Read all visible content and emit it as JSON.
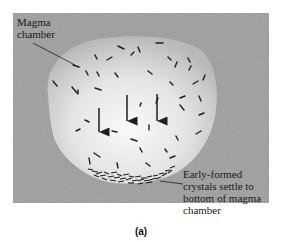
{
  "figure": {
    "caption": "(a)",
    "labels": {
      "magma_chamber": [
        "Magma",
        "chamber"
      ],
      "settled_crystals": [
        "Early-formed",
        "crystals settle to",
        "bottom of magma",
        "chamber"
      ]
    },
    "icons": {
      "arrows": "down-arrow-icon",
      "crystals": "crystal-dash-icon"
    },
    "colors": {
      "background_panel": "#a9a9a9",
      "chamber_light": "#f2f2f2",
      "chamber_edge": "#bdbdbd",
      "crystal": "#1e1e1e",
      "text": "#1a1a1a"
    },
    "arrow_count": 3
  }
}
